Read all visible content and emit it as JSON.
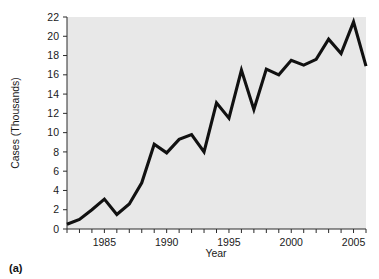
{
  "figure": {
    "caption": "(a)"
  },
  "chart_data": {
    "type": "line",
    "title": "",
    "xlabel": "Year",
    "ylabel": "Cases (Thousands)",
    "x": [
      1982,
      1983,
      1984,
      1985,
      1986,
      1987,
      1988,
      1989,
      1990,
      1991,
      1992,
      1993,
      1994,
      1995,
      1996,
      1997,
      1998,
      1999,
      2000,
      2001,
      2002,
      2003,
      2004,
      2005,
      2006
    ],
    "values": [
      0.5,
      1.0,
      2.0,
      3.1,
      1.5,
      2.6,
      4.8,
      8.8,
      7.9,
      9.3,
      9.8,
      8.0,
      13.1,
      11.5,
      16.5,
      12.4,
      16.6,
      16.0,
      17.5,
      17.0,
      17.6,
      19.7,
      18.2,
      21.5,
      16.9
    ],
    "xlim": [
      1982,
      2006
    ],
    "ylim": [
      0,
      22
    ],
    "yticks": [
      0,
      2,
      4,
      6,
      8,
      10,
      12,
      14,
      16,
      18,
      20,
      22
    ],
    "ytick_labels": [
      "0",
      "2",
      "4",
      "6",
      "8",
      "10",
      "12",
      "14",
      "16",
      "18",
      "20",
      "22"
    ],
    "xticks": [
      1982,
      1983,
      1984,
      1985,
      1986,
      1987,
      1988,
      1989,
      1990,
      1991,
      1992,
      1993,
      1994,
      1995,
      1996,
      1997,
      1998,
      1999,
      2000,
      2001,
      2002,
      2003,
      2004,
      2005,
      2006
    ],
    "xtick_labels_shown": [
      "1985",
      "1990",
      "1995",
      "2000",
      "2005"
    ],
    "xtick_labels_shown_values": [
      1985,
      1990,
      1995,
      2000,
      2005
    ],
    "grid": false,
    "legend": false,
    "legend_position": "none",
    "line_color": "#111111",
    "panel_color": "#e8e8e8",
    "background_color": "#ffffff"
  }
}
